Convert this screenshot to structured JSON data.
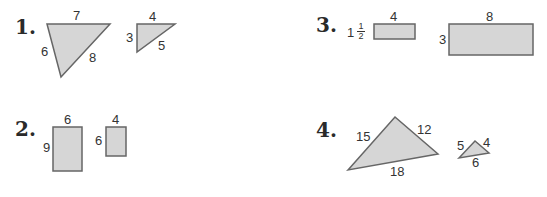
{
  "problems": [
    {
      "number": "1.",
      "figures": [
        {
          "type": "triangle",
          "sides": {
            "top": "7",
            "left": "6",
            "right": "8"
          }
        },
        {
          "type": "triangle",
          "sides": {
            "top": "4",
            "left": "3",
            "hyp": "5"
          }
        }
      ]
    },
    {
      "number": "2.",
      "figures": [
        {
          "type": "rectangle",
          "width": "6",
          "height": "9"
        },
        {
          "type": "rectangle",
          "width": "4",
          "height": "6"
        }
      ]
    },
    {
      "number": "3.",
      "figures": [
        {
          "type": "rectangle",
          "width": "4",
          "height_whole": "1",
          "height_num": "1",
          "height_den": "2"
        },
        {
          "type": "rectangle",
          "width": "8",
          "height": "3"
        }
      ]
    },
    {
      "number": "4.",
      "figures": [
        {
          "type": "triangle",
          "sides": {
            "left": "15",
            "right": "12",
            "bottom": "18"
          }
        },
        {
          "type": "triangle",
          "sides": {
            "left": "5",
            "right": "4",
            "bottom": "6"
          }
        }
      ]
    }
  ],
  "colors": {
    "fill": "#d6d6d6",
    "stroke": "#666666"
  }
}
